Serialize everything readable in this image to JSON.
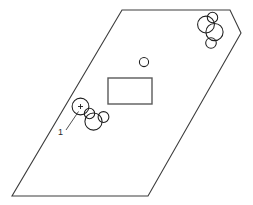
{
  "diagram": {
    "background_color": "#ffffff",
    "canvas": {
      "width": 253,
      "height": 205
    },
    "outline": {
      "name": "site-boundary-outline",
      "stroke_color": "#3c3c3c",
      "stroke_width": 1.1,
      "closed": true,
      "vertices": [
        {
          "x": 122,
          "y": 10
        },
        {
          "x": 230,
          "y": 10
        },
        {
          "x": 241,
          "y": 33
        },
        {
          "x": 148,
          "y": 196
        },
        {
          "x": 12,
          "y": 196
        }
      ]
    },
    "rectangle": {
      "name": "central-rectangle",
      "x": 108,
      "y": 78,
      "width": 44,
      "height": 26,
      "stroke_color": "#5a5a5a",
      "stroke_width": 1.4
    },
    "small_circle": {
      "name": "isolated-small-circle",
      "cx": 144,
      "cy": 62,
      "r": 4.6,
      "stroke_color": "#1e1e1e"
    },
    "left_cluster": {
      "name": "left-circle-cluster",
      "circles": [
        {
          "id": "lc-1",
          "cx": 80.5,
          "cy": 106.5,
          "r": 8.4,
          "crosshair": true
        },
        {
          "id": "lc-2",
          "cx": 89.5,
          "cy": 113.5,
          "r": 5.2,
          "crosshair": false
        },
        {
          "id": "lc-3",
          "cx": 103.5,
          "cy": 117.0,
          "r": 5.4,
          "crosshair": false
        },
        {
          "id": "lc-4",
          "cx": 93.5,
          "cy": 121.5,
          "r": 8.6,
          "crosshair": false
        }
      ],
      "crosshair_size": 5.0
    },
    "right_cluster": {
      "name": "right-circle-cluster",
      "circles": [
        {
          "id": "rc-1",
          "cx": 206.0,
          "cy": 24.5,
          "r": 8.4
        },
        {
          "id": "rc-2",
          "cx": 212.5,
          "cy": 17.5,
          "r": 5.2
        },
        {
          "id": "rc-3",
          "cx": 214.5,
          "cy": 32.0,
          "r": 8.6
        },
        {
          "id": "rc-4",
          "cx": 211.0,
          "cy": 43.0,
          "r": 5.3
        }
      ]
    },
    "callout": {
      "name": "callout-1",
      "label": "1",
      "label_x": 58,
      "label_y": 135,
      "leader_from": {
        "x": 66,
        "y": 130
      },
      "leader_to": {
        "x": 78.5,
        "y": 111.5
      },
      "stroke_color": "#3c3c3c"
    }
  }
}
